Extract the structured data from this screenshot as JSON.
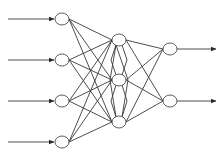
{
  "diagram": {
    "type": "feedforward-neural-network",
    "layers": [
      {
        "name": "input",
        "node_count": 4,
        "has_incoming_arrows": true
      },
      {
        "name": "hidden",
        "node_count": 3
      },
      {
        "name": "output",
        "node_count": 2,
        "has_outgoing_arrows": true
      }
    ],
    "connections": [
      {
        "from": "input",
        "to": "hidden",
        "pattern": "fully-connected"
      },
      {
        "from": "hidden",
        "to": "hidden",
        "pattern": "lateral-diamond"
      },
      {
        "from": "hidden",
        "to": "output",
        "pattern": "fully-connected"
      }
    ],
    "colors": {
      "stroke": "#3a3a3a",
      "node_fill": "#ffffff",
      "background": "#ffffff"
    }
  }
}
